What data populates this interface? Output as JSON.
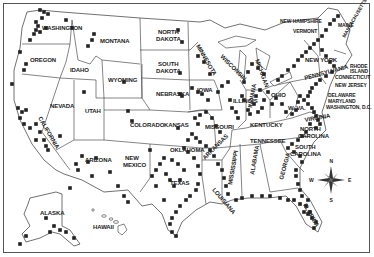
{
  "map": {
    "title": "",
    "colors": {
      "border": "#333333",
      "marker": "#222222",
      "background": "#ffffff"
    },
    "states": [
      {
        "name": "WASHINGTON",
        "x": 42,
        "y": 30
      },
      {
        "name": "OREGON",
        "x": 30,
        "y": 62
      },
      {
        "name": "CALIFORNIA",
        "x": 38,
        "y": 118,
        "rotate": 60
      },
      {
        "name": "NEVADA",
        "x": 50,
        "y": 108
      },
      {
        "name": "IDAHO",
        "x": 70,
        "y": 72
      },
      {
        "name": "MONTANA",
        "x": 100,
        "y": 43
      },
      {
        "name": "WYOMING",
        "x": 108,
        "y": 82
      },
      {
        "name": "UTAH",
        "x": 85,
        "y": 113
      },
      {
        "name": "COLORADO",
        "x": 130,
        "y": 127
      },
      {
        "name": "ARIZONA",
        "x": 85,
        "y": 162
      },
      {
        "name": "NEW",
        "x": 125,
        "y": 160
      },
      {
        "name": "MEXICO",
        "x": 123,
        "y": 167
      },
      {
        "name": "NORTH",
        "x": 158,
        "y": 34
      },
      {
        "name": "DAKOTA",
        "x": 156,
        "y": 41
      },
      {
        "name": "SOUTH",
        "x": 158,
        "y": 66
      },
      {
        "name": "DAKOTA2",
        "label": "DAKOTA",
        "x": 156,
        "y": 73
      },
      {
        "name": "NEBRASKA",
        "x": 156,
        "y": 96
      },
      {
        "name": "KANSAS",
        "x": 164,
        "y": 127
      },
      {
        "name": "OKLAHOMA",
        "x": 170,
        "y": 152
      },
      {
        "name": "TEXAS",
        "x": 170,
        "y": 185
      },
      {
        "name": "MINNESOTA",
        "x": 196,
        "y": 46,
        "rotate": 60
      },
      {
        "name": "IOWA",
        "x": 197,
        "y": 92
      },
      {
        "name": "MISSOURI",
        "x": 205,
        "y": 129
      },
      {
        "name": "ARKANSAS",
        "x": 205,
        "y": 160,
        "rotate": -45
      },
      {
        "name": "LOUISIANA",
        "x": 212,
        "y": 190,
        "rotate": 50
      },
      {
        "name": "WISCONSIN",
        "x": 220,
        "y": 57,
        "rotate": 45
      },
      {
        "name": "ILLINOIS",
        "x": 233,
        "y": 103
      },
      {
        "name": "MISSISSIPPI",
        "x": 232,
        "y": 185,
        "rotate": -80
      },
      {
        "name": "MICHIGAN",
        "x": 255,
        "y": 60,
        "rotate": 70
      },
      {
        "name": "INDIANA",
        "x": 252,
        "y": 108,
        "rotate": -80
      },
      {
        "name": "KENTUCKY",
        "x": 250,
        "y": 127
      },
      {
        "name": "TENNESSEE",
        "x": 250,
        "y": 143
      },
      {
        "name": "ALABAMA",
        "x": 254,
        "y": 175,
        "rotate": -80
      },
      {
        "name": "OHIO",
        "x": 271,
        "y": 97
      },
      {
        "name": "GEORGIA",
        "x": 283,
        "y": 180,
        "rotate": -75
      },
      {
        "name": "WEST VIRGINIA",
        "label": "W. VA.",
        "x": 288,
        "y": 110
      },
      {
        "name": "VIRGINIA",
        "x": 305,
        "y": 122,
        "rotate": -10
      },
      {
        "name": "NORTH CAROLINA",
        "label": "NORTH",
        "x": 300,
        "y": 131
      },
      {
        "name": "NORTH CAROLINA2",
        "label": "CAROLINA",
        "x": 298,
        "y": 138
      },
      {
        "name": "SOUTH CAROLINA",
        "label": "SOUTH",
        "x": 295,
        "y": 149
      },
      {
        "name": "SOUTH CAROLINA2",
        "label": "CAROLINA",
        "x": 290,
        "y": 156
      },
      {
        "name": "FLORIDA",
        "x": 303,
        "y": 205,
        "rotate": 60
      },
      {
        "name": "PENNSYLVANIA",
        "x": 305,
        "y": 80,
        "rotate": -15
      },
      {
        "name": "NEW YORK",
        "x": 305,
        "y": 62
      },
      {
        "name": "ALASKA",
        "x": 40,
        "y": 215
      },
      {
        "name": "HAWAII",
        "x": 93,
        "y": 229
      }
    ],
    "callouts": [
      {
        "label": "NEW HAMPSHIRE",
        "x": 280,
        "y": 23
      },
      {
        "label": "VERMONT",
        "x": 293,
        "y": 33
      },
      {
        "label": "MAINE",
        "x": 338,
        "y": 27
      },
      {
        "label": "MASSACHUSETTS",
        "x": 345,
        "y": 38,
        "rotate": -60
      },
      {
        "label": "RHODE",
        "x": 350,
        "y": 68
      },
      {
        "label": "ISLAND",
        "x": 350,
        "y": 73
      },
      {
        "label": "CONNECTICUT",
        "x": 335,
        "y": 79
      },
      {
        "label": "NEW JERSEY",
        "x": 335,
        "y": 87
      },
      {
        "label": "DELAWARE",
        "x": 328,
        "y": 97
      },
      {
        "label": "MARYLAND",
        "x": 328,
        "y": 103
      },
      {
        "label": "WASHINGTON, D.C.",
        "x": 326,
        "y": 109
      }
    ],
    "compass": {
      "n": "N",
      "s": "S",
      "e": "E",
      "w": "W",
      "x": 331,
      "y": 180
    },
    "marker_count": 230
  }
}
